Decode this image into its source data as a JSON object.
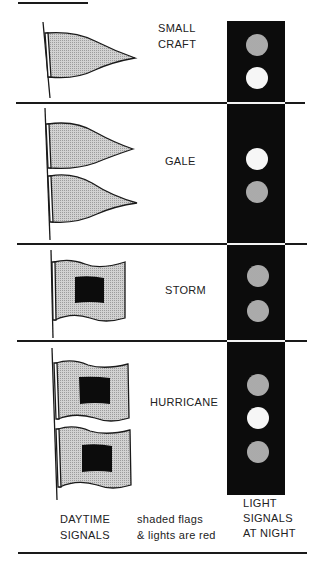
{
  "colors": {
    "column": "#0c0c0c",
    "red_shade": "#bdbdbd",
    "white_light": "#f6f6f6",
    "line": "#1a1a1a"
  },
  "rows": [
    {
      "name": "small-craft",
      "label_lines": [
        "SMALL",
        "CRAFT"
      ],
      "day_signal": {
        "type": "pennant",
        "count": 1,
        "color": "red"
      },
      "night_lights": [
        "red",
        "white"
      ]
    },
    {
      "name": "gale",
      "label_lines": [
        "GALE"
      ],
      "day_signal": {
        "type": "pennant",
        "count": 2,
        "color": "red"
      },
      "night_lights": [
        "white",
        "red"
      ]
    },
    {
      "name": "storm",
      "label_lines": [
        "STORM"
      ],
      "day_signal": {
        "type": "square-flag-black-center",
        "count": 1,
        "color": "red"
      },
      "night_lights": [
        "red",
        "red"
      ]
    },
    {
      "name": "hurricane",
      "label_lines": [
        "HURRICANE"
      ],
      "day_signal": {
        "type": "square-flag-black-center",
        "count": 2,
        "color": "red"
      },
      "night_lights": [
        "red",
        "white",
        "red"
      ]
    }
  ],
  "footer": {
    "daytime": [
      "DAYTIME",
      "SIGNALS"
    ],
    "legend": [
      "shaded flags",
      "& lights are red"
    ],
    "night": [
      "LIGHT",
      "SIGNALS",
      "AT NIGHT"
    ]
  }
}
